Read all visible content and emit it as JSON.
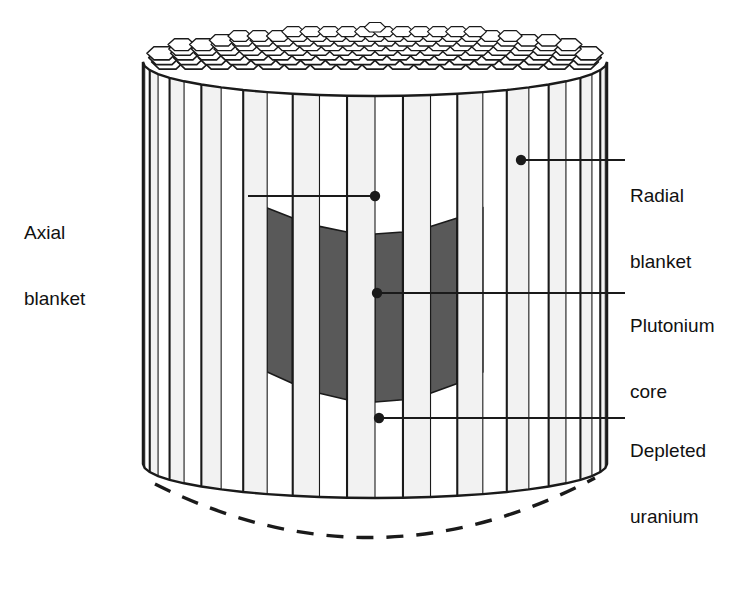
{
  "figure": {
    "background": "#ffffff",
    "line_color": "#1a1a1a",
    "core_fill": "#595959",
    "blanket_fill": "#ffffff",
    "column_shade": "#f2f2f2"
  },
  "labels": {
    "axial_blanket": {
      "line1": "Axial",
      "line2": "blanket"
    },
    "radial_blanket": {
      "line1": "Radial",
      "line2": "blanket"
    },
    "plutonium_core": {
      "line1": "Plutonium",
      "line2": "core"
    },
    "depleted_uranium": {
      "line1": "Depleted",
      "line2": "uranium"
    }
  },
  "callouts": [
    {
      "name": "axial-blanket",
      "dot_x": 375,
      "dot_y": 196,
      "elbow_x": 248,
      "text_x": 150,
      "text_y": 196
    },
    {
      "name": "radial-blanket",
      "dot_x": 521,
      "dot_y": 160,
      "elbow_x": 625,
      "text_x": 625,
      "text_y": 160
    },
    {
      "name": "plutonium-core",
      "dot_x": 377,
      "dot_y": 293,
      "elbow_x": 625,
      "text_x": 625,
      "text_y": 293
    },
    {
      "name": "depleted-uranium",
      "dot_x": 379,
      "dot_y": 418,
      "elbow_x": 625,
      "text_x": 625,
      "text_y": 418
    }
  ],
  "geometry": {
    "cylinder_left": 143,
    "cylinder_right": 607,
    "top_front_y": 96,
    "bottom_front_y": 498,
    "hex_top_apex_y": 22,
    "core_left": 268,
    "core_right": 477,
    "core_top_y": 208,
    "core_bottom_y": 372,
    "dashed_arc_y": 560,
    "column_count": 26
  }
}
